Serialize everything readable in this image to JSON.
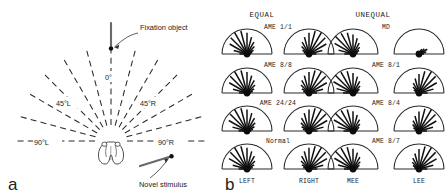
{
  "figure": {
    "panel_a": {
      "letter": "a",
      "annotations": {
        "fixation_object": "Fixation object",
        "novel_stimulus": "Novel stimulus",
        "zero": "0°",
        "left_45": "45°L",
        "right_45": "45°R",
        "left_90": "90°L",
        "right_90": "90°R"
      },
      "fan": {
        "ray_count": 13,
        "ray_spacing_deg": 15,
        "span_deg": 180,
        "dashed": true,
        "center_icon": "toad-head-icon"
      }
    },
    "panel_b": {
      "letter": "b",
      "column_headers": [
        "EQUAL",
        "UNEQUAL"
      ],
      "axis_labels": {
        "left_col_left": "LEFT",
        "left_col_right": "RIGHT",
        "right_col_left": "MEE",
        "right_col_right": "LEE"
      },
      "rows": [
        {
          "left_label": "AME 1/1",
          "right_label": "MD"
        },
        {
          "left_label": "AME 8/8",
          "right_label": "AME 8/1"
        },
        {
          "left_label": "AME 24/24",
          "right_label": "AME 8/4"
        },
        {
          "left_label": "Normal",
          "right_label": "AME 8/7"
        }
      ]
    }
  },
  "chart_data": {
    "type": "bar",
    "subtitle": "Each hemicircle: fan of radial spokes whose lengths encode response frequency per 15° bin over a 180° field",
    "xlabel": "Stimulus angle (degrees)",
    "ylabel": "Relative response frequency (normalized spoke length)",
    "angle_bins_deg": [
      0,
      15,
      30,
      45,
      60,
      75,
      90,
      105,
      120,
      135,
      150,
      165,
      180
    ],
    "ylim": [
      0,
      1
    ],
    "grid": false,
    "legend": "none",
    "columns": [
      "EQUAL",
      "UNEQUAL"
    ],
    "panels": [
      {
        "group": "EQUAL",
        "condition": "AME 1/1",
        "row": 1,
        "plots": [
          {
            "eye": "LEFT",
            "values": [
              0.3,
              0.55,
              0.8,
              0.92,
              1.0,
              0.95,
              0.85,
              0.7,
              0.55,
              0.42,
              0.3,
              0.22,
              0.15
            ]
          },
          {
            "eye": "RIGHT",
            "values": [
              0.15,
              0.22,
              0.3,
              0.42,
              0.55,
              0.7,
              0.85,
              0.95,
              1.0,
              0.92,
              0.8,
              0.55,
              0.3
            ]
          }
        ]
      },
      {
        "group": "UNEQUAL",
        "condition": "MD",
        "row": 1,
        "plots": [
          {
            "eye": "MEE",
            "values": [
              0.35,
              0.6,
              0.85,
              1.0,
              0.95,
              0.88,
              0.78,
              0.65,
              0.5,
              0.38,
              0.28,
              0.2,
              0.14
            ]
          },
          {
            "eye": "LEE",
            "values": [
              0.0,
              0.0,
              0.0,
              0.0,
              0.0,
              0.0,
              0.0,
              0.0,
              0.22,
              0.3,
              0.38,
              0.3,
              0.2
            ]
          }
        ]
      },
      {
        "group": "EQUAL",
        "condition": "AME 8/8",
        "row": 2,
        "plots": [
          {
            "eye": "LEFT",
            "values": [
              0.32,
              0.58,
              0.82,
              0.95,
              1.0,
              0.93,
              0.84,
              0.72,
              0.58,
              0.45,
              0.33,
              0.24,
              0.16
            ]
          },
          {
            "eye": "RIGHT",
            "values": [
              0.16,
              0.24,
              0.33,
              0.45,
              0.58,
              0.72,
              0.84,
              0.93,
              1.0,
              0.95,
              0.82,
              0.58,
              0.32
            ]
          }
        ]
      },
      {
        "group": "UNEQUAL",
        "condition": "AME 8/1",
        "row": 2,
        "plots": [
          {
            "eye": "MEE",
            "values": [
              0.4,
              0.68,
              0.9,
              1.0,
              0.96,
              0.9,
              0.8,
              0.68,
              0.54,
              0.4,
              0.3,
              0.22,
              0.15
            ]
          },
          {
            "eye": "LEE",
            "values": [
              0.1,
              0.16,
              0.24,
              0.34,
              0.46,
              0.6,
              0.76,
              0.9,
              1.0,
              0.94,
              0.82,
              0.6,
              0.34
            ]
          }
        ]
      },
      {
        "group": "EQUAL",
        "condition": "AME 24/24",
        "row": 3,
        "plots": [
          {
            "eye": "LEFT",
            "values": [
              0.34,
              0.6,
              0.84,
              0.96,
              1.0,
              0.94,
              0.86,
              0.74,
              0.6,
              0.46,
              0.34,
              0.25,
              0.17
            ]
          },
          {
            "eye": "RIGHT",
            "values": [
              0.17,
              0.25,
              0.34,
              0.46,
              0.6,
              0.74,
              0.86,
              0.94,
              1.0,
              0.96,
              0.84,
              0.6,
              0.34
            ]
          }
        ]
      },
      {
        "group": "UNEQUAL",
        "condition": "AME 8/4",
        "row": 3,
        "plots": [
          {
            "eye": "MEE",
            "values": [
              0.38,
              0.64,
              0.88,
              1.0,
              0.95,
              0.89,
              0.79,
              0.66,
              0.52,
              0.39,
              0.29,
              0.21,
              0.15
            ]
          },
          {
            "eye": "LEE",
            "values": [
              0.12,
              0.18,
              0.26,
              0.36,
              0.48,
              0.62,
              0.78,
              0.92,
              1.0,
              0.93,
              0.8,
              0.58,
              0.32
            ]
          }
        ]
      },
      {
        "group": "EQUAL",
        "condition": "Normal",
        "row": 4,
        "plots": [
          {
            "eye": "LEFT",
            "values": [
              0.33,
              0.59,
              0.83,
              0.95,
              1.0,
              0.94,
              0.85,
              0.73,
              0.59,
              0.45,
              0.33,
              0.24,
              0.16
            ]
          },
          {
            "eye": "RIGHT",
            "values": [
              0.16,
              0.24,
              0.33,
              0.45,
              0.59,
              0.73,
              0.85,
              0.94,
              1.0,
              0.95,
              0.83,
              0.59,
              0.33
            ]
          }
        ]
      },
      {
        "group": "UNEQUAL",
        "condition": "AME 8/7",
        "row": 4,
        "plots": [
          {
            "eye": "MEE",
            "values": [
              0.36,
              0.62,
              0.86,
              1.0,
              0.96,
              0.9,
              0.81,
              0.68,
              0.55,
              0.41,
              0.3,
              0.22,
              0.15
            ]
          },
          {
            "eye": "LEE",
            "values": [
              0.14,
              0.2,
              0.28,
              0.38,
              0.5,
              0.64,
              0.8,
              0.93,
              1.0,
              0.94,
              0.81,
              0.59,
              0.33
            ]
          }
        ]
      }
    ]
  }
}
